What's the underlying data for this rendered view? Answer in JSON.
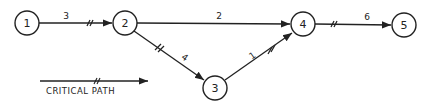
{
  "diagram": {
    "type": "network-critical-path",
    "nodes": [
      {
        "id": "1",
        "label": "1",
        "x": 27,
        "y": 23
      },
      {
        "id": "2",
        "label": "2",
        "x": 125,
        "y": 23
      },
      {
        "id": "3",
        "label": "3",
        "x": 215,
        "y": 88
      },
      {
        "id": "4",
        "label": "4",
        "x": 303,
        "y": 24
      },
      {
        "id": "5",
        "label": "5",
        "x": 404,
        "y": 25
      }
    ],
    "edges": [
      {
        "from": "1",
        "to": "2",
        "weight": "3",
        "critical": true
      },
      {
        "from": "2",
        "to": "4",
        "weight": "2",
        "critical": false
      },
      {
        "from": "2",
        "to": "3",
        "weight": "4",
        "critical": true
      },
      {
        "from": "3",
        "to": "4",
        "weight": "1",
        "critical": true
      },
      {
        "from": "4",
        "to": "5",
        "weight": "6",
        "critical": true
      }
    ],
    "legend": {
      "label": "CRITICAL PATH"
    }
  }
}
